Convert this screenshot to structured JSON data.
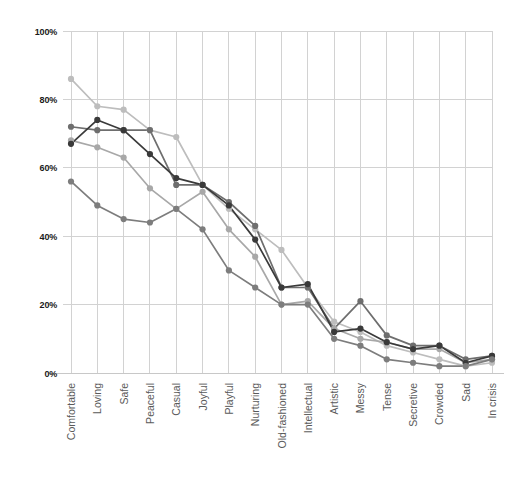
{
  "chart_data": {
    "type": "line",
    "title": "",
    "subtitle": "",
    "xlabel": "",
    "ylabel": "",
    "ylim": [
      0,
      100
    ],
    "grid": true,
    "legend_position": "none",
    "y_ticks": [
      0,
      20,
      40,
      60,
      80,
      100
    ],
    "y_tick_labels": [
      "0%",
      "20%",
      "40%",
      "60%",
      "80%",
      "100%"
    ],
    "categories": [
      "Comfortable",
      "Loving",
      "Safe",
      "Peaceful",
      "Casual",
      "Joyful",
      "Playful",
      "Nurturing",
      "Old-fashioned",
      "Intellectual",
      "Artistic",
      "Messy",
      "Tense",
      "Secretive",
      "Crowded",
      "Sad",
      "In crisis"
    ],
    "series": [
      {
        "name": "series-1",
        "color": "#bdbdbd",
        "values": [
          86,
          78,
          77,
          71,
          69,
          55,
          48,
          42,
          36,
          25,
          15,
          12,
          8,
          6,
          4,
          2,
          3
        ]
      },
      {
        "name": "series-2",
        "color": "#6e6e6e",
        "values": [
          72,
          71,
          71,
          71,
          55,
          55,
          50,
          43,
          25,
          25,
          13,
          21,
          11,
          8,
          8,
          4,
          5
        ]
      },
      {
        "name": "series-3",
        "color": "#a8a8a8",
        "values": [
          68,
          66,
          63,
          54,
          48,
          53,
          42,
          34,
          20,
          21,
          13,
          10,
          9,
          7,
          7,
          3,
          4
        ]
      },
      {
        "name": "series-4",
        "color": "#3a3a3a",
        "values": [
          67,
          74,
          71,
          64,
          57,
          55,
          49,
          39,
          25,
          26,
          12,
          13,
          9,
          7,
          8,
          3,
          5
        ]
      },
      {
        "name": "series-5",
        "color": "#7d7d7d",
        "values": [
          56,
          49,
          45,
          44,
          48,
          42,
          30,
          25,
          20,
          20,
          10,
          8,
          4,
          3,
          2,
          2,
          4
        ]
      }
    ]
  },
  "axis": {
    "y_axis_name": "percentage-axis",
    "x_axis_name": "attribute-axis"
  }
}
